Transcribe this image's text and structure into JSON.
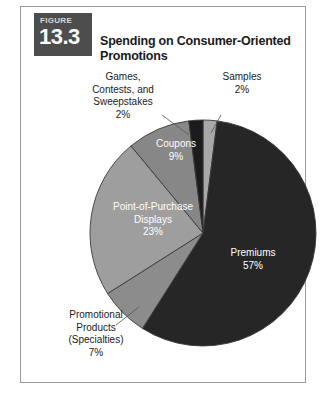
{
  "figure": {
    "label_word": "FIGURE",
    "number": "13.3",
    "title": "Spending on Consumer-Oriented Promotions"
  },
  "chart_data": {
    "type": "pie",
    "title": "Spending on Consumer-Oriented Promotions",
    "xlabel": "",
    "ylabel": "",
    "legend_position": "none",
    "grid": false,
    "units": "percent",
    "categories": [
      "Samples",
      "Premiums",
      "Promotional Products (Specialties)",
      "Point-of-Purchase Displays",
      "Coupons",
      "Games, Contests, and Sweepstakes"
    ],
    "values": [
      2,
      57,
      7,
      23,
      9,
      2
    ],
    "slices": [
      {
        "name": "Samples",
        "label": "Samples",
        "value": 2,
        "value_label": "2%",
        "color": "#a8a8a8",
        "label_placement": "outside",
        "label_color": "#1a1a1a"
      },
      {
        "name": "Premiums",
        "label": "Premiums",
        "value": 57,
        "value_label": "57%",
        "color": "#262626",
        "label_placement": "inside",
        "label_color": "#ffffff"
      },
      {
        "name": "Promotional Products (Specialties)",
        "label": "Promotional\nProducts\n(Specialties)",
        "value": 7,
        "value_label": "7%",
        "color": "#8c8c8c",
        "label_placement": "outside",
        "label_color": "#1a1a1a"
      },
      {
        "name": "Point-of-Purchase Displays",
        "label": "Point-of-Purchase\nDisplays",
        "value": 23,
        "value_label": "23%",
        "color": "#9e9e9e",
        "label_placement": "inside",
        "label_color": "#ffffff"
      },
      {
        "name": "Coupons",
        "label": "Coupons",
        "value": 9,
        "value_label": "9%",
        "color": "#878787",
        "label_placement": "inside",
        "label_color": "#ffffff"
      },
      {
        "name": "Games, Contests, and Sweepstakes",
        "label": "Games,\nContests, and\nSweepstakes",
        "value": 2,
        "value_label": "2%",
        "color": "#1c1c1c",
        "label_placement": "outside",
        "label_color": "#1a1a1a"
      }
    ]
  },
  "labels": {
    "games": "Games,\nContests, and\nSweepstakes\n2%",
    "samples": "Samples\n2%",
    "coupons": "Coupons\n9%",
    "pop": "Point-of-Purchase\nDisplays\n23%",
    "premiums": "Premiums\n57%",
    "promo": "Promotional\nProducts\n(Specialties)\n7%"
  },
  "colors": {
    "badge_bg": "#4d4d4d",
    "frame_border": "#9a9a9a",
    "page_bg": "#ffffff",
    "slice_outline": "#3a3a3a"
  }
}
